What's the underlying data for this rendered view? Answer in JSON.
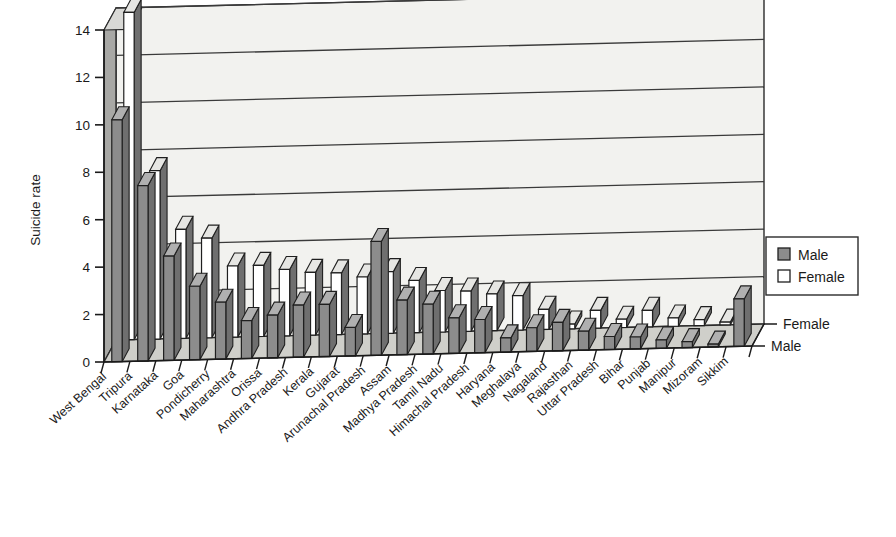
{
  "chart_data": {
    "type": "bar",
    "title": "",
    "subtitle": "",
    "xlabel": "",
    "ylabel": "Suicide rate",
    "zlabel": "",
    "ylim": [
      0,
      14
    ],
    "yticks": [
      0,
      2,
      4,
      6,
      8,
      10,
      12,
      14
    ],
    "grid": true,
    "projection": "3d",
    "legend_position": "right",
    "depth_axis_labels": [
      "Female",
      "Male"
    ],
    "categories": [
      "West Bengal",
      "Tripura",
      "Karnataka",
      "Goa",
      "Pondicherry",
      "Maharashtra",
      "Orissa",
      "Andhra Pradesh",
      "Kerala",
      "Gujarat",
      "Arunachal Pradesh",
      "Assam",
      "Madhya Pradesh",
      "Tamil Nadu",
      "Himachal Pradesh",
      "Haryana",
      "Meghalaya",
      "Nagaland",
      "Rajasthan",
      "Uttar Pradesh",
      "Bihar",
      "Punjab",
      "Manipur",
      "Mizoram",
      "Sikkim"
    ],
    "series": [
      {
        "name": "Male",
        "color": "#8c8c8c",
        "values": [
          10.2,
          7.4,
          4.4,
          3.1,
          2.4,
          1.6,
          1.8,
          2.2,
          2.2,
          1.2,
          4.8,
          2.3,
          2.1,
          1.5,
          1.4,
          0.6,
          1.0,
          1.2,
          0.8,
          0.55,
          0.5,
          0.35,
          0.25,
          0.12,
          2.0
        ]
      },
      {
        "name": "Female",
        "color": "#ffffff",
        "values": [
          13.8,
          7.1,
          4.6,
          4.2,
          3.0,
          3.0,
          2.8,
          2.65,
          2.6,
          2.4,
          2.6,
          2.2,
          1.75,
          1.7,
          1.55,
          1.45,
          0.85,
          0.2,
          0.75,
          0.35,
          0.7,
          0.35,
          0.25,
          0.12,
          0.0
        ]
      }
    ]
  },
  "legend": {
    "items": [
      {
        "label": "Male",
        "swatch": "#8c8c8c"
      },
      {
        "label": "Female",
        "swatch": "#ffffff"
      }
    ]
  }
}
